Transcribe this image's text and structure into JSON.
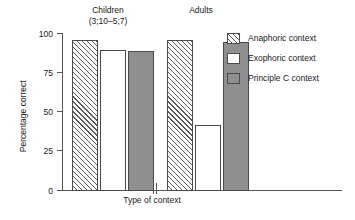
{
  "chart_data": {
    "type": "bar",
    "title": "",
    "xlabel": "Type of context",
    "ylabel": "Percentage correct",
    "ylim": [
      0,
      100
    ],
    "yticks": [
      0,
      25,
      50,
      75,
      100
    ],
    "ytick_labels": [
      "0",
      "25",
      "50",
      "75",
      "100"
    ],
    "grid": false,
    "axis_break": true,
    "legend_position": "right",
    "categories": [
      "Children (3;10–5;7)",
      "Adults"
    ],
    "group_labels": [
      {
        "line1": "Children",
        "line2": "(3;10–5;7)"
      },
      {
        "line1": "Adults",
        "line2": ""
      }
    ],
    "series": [
      {
        "name": "Anaphoric context",
        "fill": "hatched",
        "color": "#ffffff",
        "values": [
          96,
          96
        ]
      },
      {
        "name": "Exophoric context",
        "fill": "solid",
        "color": "#ffffff",
        "values": [
          90,
          42
        ]
      },
      {
        "name": "Principle C context",
        "fill": "solid",
        "color": "#8f8f8f",
        "values": [
          89,
          95
        ]
      }
    ],
    "legend_entries": [
      {
        "label": "Anaphoric context",
        "swatch": "hatched"
      },
      {
        "label": "Exophoric context",
        "swatch": "white"
      },
      {
        "label": "Principle C context",
        "swatch": "gray"
      }
    ]
  },
  "colors": {
    "axis": "#555555",
    "bar_outline": "#4a4a4a",
    "hatch_stroke": "#5a5a5a",
    "gray_fill": "#8f8f8f",
    "white_fill": "#ffffff",
    "text": "#1a1a1a",
    "background": "#ffffff"
  }
}
